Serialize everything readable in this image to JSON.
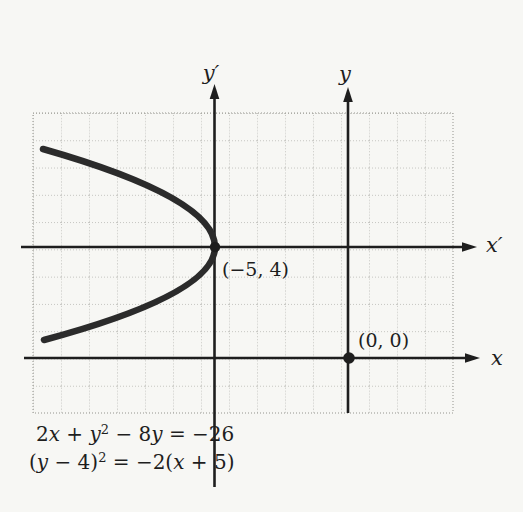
{
  "figure": {
    "colors": {
      "background": "#f7f7f4",
      "ink": "#1e1e1e",
      "curve": "#2b2b2b",
      "grid": "#94948e"
    },
    "axes": {
      "x_label": "x",
      "y_label": "y",
      "x_prime_label": "x′",
      "y_prime_label": "y′"
    },
    "points": {
      "vertex_label": "(−5, 4)",
      "origin_label": "(0, 0)"
    },
    "equations": {
      "line1": "2x + y² − 8y = −26",
      "line2": "(y − 4)² = −2(x + 5)",
      "line1_runs": [
        {
          "t": "2",
          "s": "rm"
        },
        {
          "t": "x",
          "s": "it"
        },
        {
          "t": " + ",
          "s": "rm"
        },
        {
          "t": "y",
          "s": "it"
        },
        {
          "t": "2",
          "s": "sup"
        },
        {
          "t": " − 8",
          "s": "rm"
        },
        {
          "t": "y",
          "s": "it"
        },
        {
          "t": " = −26",
          "s": "rm"
        }
      ],
      "line2_runs": [
        {
          "t": "(",
          "s": "rm"
        },
        {
          "t": "y",
          "s": "it"
        },
        {
          "t": " − 4)",
          "s": "rm"
        },
        {
          "t": "2",
          "s": "sup"
        },
        {
          "t": " = −2(",
          "s": "rm"
        },
        {
          "t": "x",
          "s": "it"
        },
        {
          "t": " + 5)",
          "s": "rm"
        }
      ]
    }
  },
  "chart_data": {
    "type": "line",
    "title": "",
    "xlabel": "x",
    "ylabel": "y",
    "secondary_xlabel": "x′",
    "secondary_ylabel": "y′",
    "equations": [
      "2x + y² − 8y = −26",
      "(y − 4)² = −2(x + 5)"
    ],
    "curve_type": "parabola",
    "opens": "left",
    "vertex": {
      "x": -5,
      "y": 4,
      "label": "(−5, 4)"
    },
    "marked_points": [
      {
        "x": -5,
        "y": 4,
        "label": "(−5, 4)"
      },
      {
        "x": 0,
        "y": 0,
        "label": "(0, 0)"
      }
    ],
    "series": [
      {
        "name": "(y − 4)² = −2(x + 5)",
        "points": [
          {
            "x": -11.1,
            "y": 7.5
          },
          {
            "x": -9.5,
            "y": 7
          },
          {
            "x": -7.0,
            "y": 6
          },
          {
            "x": -5.5,
            "y": 5
          },
          {
            "x": -5.0,
            "y": 4
          },
          {
            "x": -5.5,
            "y": 3
          },
          {
            "x": -7.0,
            "y": 2
          },
          {
            "x": -9.5,
            "y": 1
          },
          {
            "x": -10.6,
            "y": 0.65
          }
        ]
      }
    ],
    "axis_ranges": {
      "x": [
        -11.25,
        3.75
      ],
      "y": [
        -2,
        9
      ]
    },
    "grid": {
      "visible": true,
      "style": "dotted",
      "cell_units": 1,
      "columns": 15,
      "rows": 11
    },
    "secondary_axes": {
      "x_prime_at": "y = 4",
      "y_prime_at": "x = −5"
    },
    "legend": {
      "visible": false
    }
  }
}
